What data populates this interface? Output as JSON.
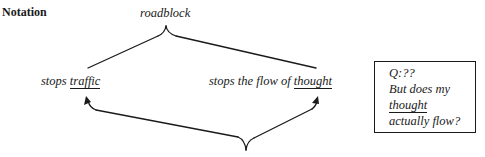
{
  "heading": "Notation",
  "diagram": {
    "top_label": "roadblock",
    "left_label": {
      "prefix": "stops ",
      "underlined": "traffic"
    },
    "right_label": {
      "prefix": "stops the flow of ",
      "underlined": "thought"
    },
    "connectors": [
      {
        "type": "brace-split",
        "from": "roadblock",
        "to": [
          "stops traffic",
          "stops the flow of thought"
        ]
      },
      {
        "type": "brace-merge-arrows",
        "to": [
          "traffic",
          "thought"
        ]
      }
    ]
  },
  "question_box": {
    "line1": "Q:??",
    "line2": "But does my",
    "line3": "thought",
    "line4": "actually flow?"
  },
  "colors": {
    "ink": "#1a1a1a",
    "background": "#ffffff"
  }
}
